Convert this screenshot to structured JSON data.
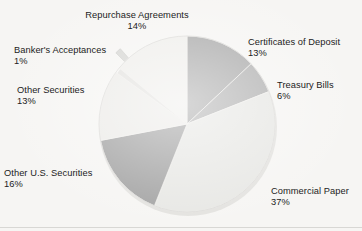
{
  "figure": {
    "background_color": "#f6f5f3",
    "text_color": "#1c1c1c"
  },
  "chart_data": {
    "type": "pie",
    "title": "",
    "subtitle": "",
    "xlabel": "",
    "ylabel": "",
    "legend_position": "none",
    "labels_outside": true,
    "units": "percent",
    "total": 100,
    "start_angle_deg": 0,
    "direction": "clockwise",
    "categories": [
      "Certificates of Deposit",
      "Treasury Bills",
      "Commercial Paper",
      "Other U.S. Securities",
      "Other Securities",
      "Banker's Acceptances",
      "Repurchase Agreements"
    ],
    "values": [
      13,
      6,
      37,
      16,
      13,
      1,
      14
    ],
    "value_labels": [
      "13%",
      "6%",
      "37%",
      "16%",
      "13%",
      "1%",
      "14%"
    ],
    "colors": [
      "#a9a9a9",
      "#b0b0b0",
      "#e7e7e4",
      "#a2a2a2",
      "#ecebe8",
      "#d6d6d3",
      "#efeeeb"
    ],
    "slices": [
      {
        "name": "Certificates of Deposit",
        "value": 13,
        "value_label": "13%",
        "color": "#a9a9a9",
        "start_deg": 0,
        "end_deg": 46.8
      },
      {
        "name": "Treasury Bills",
        "value": 6,
        "value_label": "6%",
        "color": "#b0b0b0",
        "start_deg": 46.8,
        "end_deg": 68.4
      },
      {
        "name": "Commercial Paper",
        "value": 37,
        "value_label": "37%",
        "color": "#e7e7e4",
        "start_deg": 68.4,
        "end_deg": 201.6
      },
      {
        "name": "Other U.S. Securities",
        "value": 16,
        "value_label": "16%",
        "color": "#a2a2a2",
        "start_deg": 201.6,
        "end_deg": 259.2
      },
      {
        "name": "Other Securities",
        "value": 13,
        "value_label": "13%",
        "color": "#ecebe8",
        "start_deg": 259.2,
        "end_deg": 306.0
      },
      {
        "name": "Banker's Acceptances",
        "value": 1,
        "value_label": "1%",
        "color": "#d6d6d3",
        "start_deg": 306.0,
        "end_deg": 309.6
      },
      {
        "name": "Repurchase Agreements",
        "value": 14,
        "value_label": "14%",
        "color": "#efeeeb",
        "start_deg": 309.6,
        "end_deg": 360.0
      }
    ]
  },
  "labels": {
    "repurchase_agreements": {
      "name": "Repurchase Agreements",
      "value": "14%"
    },
    "certificates_of_deposit": {
      "name": "Certificates of Deposit",
      "value": "13%"
    },
    "treasury_bills": {
      "name": "Treasury Bills",
      "value": "6%"
    },
    "commercial_paper": {
      "name": "Commercial Paper",
      "value": "37%"
    },
    "other_us_securities": {
      "name": "Other U.S. Securities",
      "value": "16%"
    },
    "other_securities": {
      "name": "Other Securities",
      "value": "13%"
    },
    "bankers_acceptances": {
      "name": "Banker's Acceptances",
      "value": "1%"
    }
  }
}
